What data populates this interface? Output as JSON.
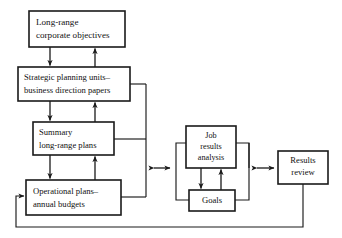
{
  "diagram": {
    "type": "flow-diagram",
    "background_color": "#ffffff",
    "line_color": "#1a1a1a",
    "nodes": [
      {
        "id": "long-range-corporate-objectives",
        "lines": [
          "Long-range",
          "corporate objectives"
        ],
        "x": 29,
        "y": 11,
        "w": 96,
        "h": 36,
        "align": "left"
      },
      {
        "id": "strategic-planning-units",
        "lines": [
          "Strategic planning units–",
          "business direction papers"
        ],
        "x": 18,
        "y": 67,
        "w": 112,
        "h": 34,
        "align": "left"
      },
      {
        "id": "summary-long-range-plans",
        "lines": [
          "Summary",
          "long-range plans"
        ],
        "x": 33,
        "y": 122,
        "w": 81,
        "h": 33,
        "align": "left"
      },
      {
        "id": "operational-plans-annual-budgets",
        "lines": [
          "Operational plans–",
          "annual budgets"
        ],
        "x": 26,
        "y": 180,
        "w": 95,
        "h": 35,
        "align": "left"
      },
      {
        "id": "job-results-analysis",
        "lines": [
          "Job",
          "results",
          "analysis"
        ],
        "x": 186,
        "y": 126,
        "w": 50,
        "h": 42,
        "align": "center"
      },
      {
        "id": "goals",
        "lines": [
          "Goals"
        ],
        "x": 189,
        "y": 190,
        "w": 46,
        "h": 21,
        "align": "center"
      },
      {
        "id": "results-review",
        "lines": [
          "Results",
          "review"
        ],
        "x": 278,
        "y": 151,
        "w": 50,
        "h": 33,
        "align": "center"
      }
    ],
    "connectors": [
      {
        "id": "objectives-to-strategic-down",
        "kind": "arrow-down"
      },
      {
        "id": "strategic-to-objectives-up",
        "kind": "arrow-up"
      },
      {
        "id": "strategic-to-summary-down",
        "kind": "arrow-down"
      },
      {
        "id": "summary-to-strategic-up",
        "kind": "arrow-up"
      },
      {
        "id": "summary-to-operational-down",
        "kind": "arrow-down"
      },
      {
        "id": "operational-to-summary-up",
        "kind": "arrow-up"
      },
      {
        "id": "left-column-bus-to-center",
        "kind": "bus"
      },
      {
        "id": "center-double-arrow",
        "kind": "double-arrow"
      },
      {
        "id": "job-results-to-goals-down",
        "kind": "arrow-down"
      },
      {
        "id": "goals-to-job-results-up",
        "kind": "arrow-up"
      },
      {
        "id": "job-goals-left-bracket",
        "kind": "bracket"
      },
      {
        "id": "job-goals-right-bracket",
        "kind": "bracket"
      },
      {
        "id": "right-double-arrow",
        "kind": "double-arrow"
      },
      {
        "id": "results-review-feedback-loop",
        "kind": "arrow-right"
      }
    ]
  }
}
